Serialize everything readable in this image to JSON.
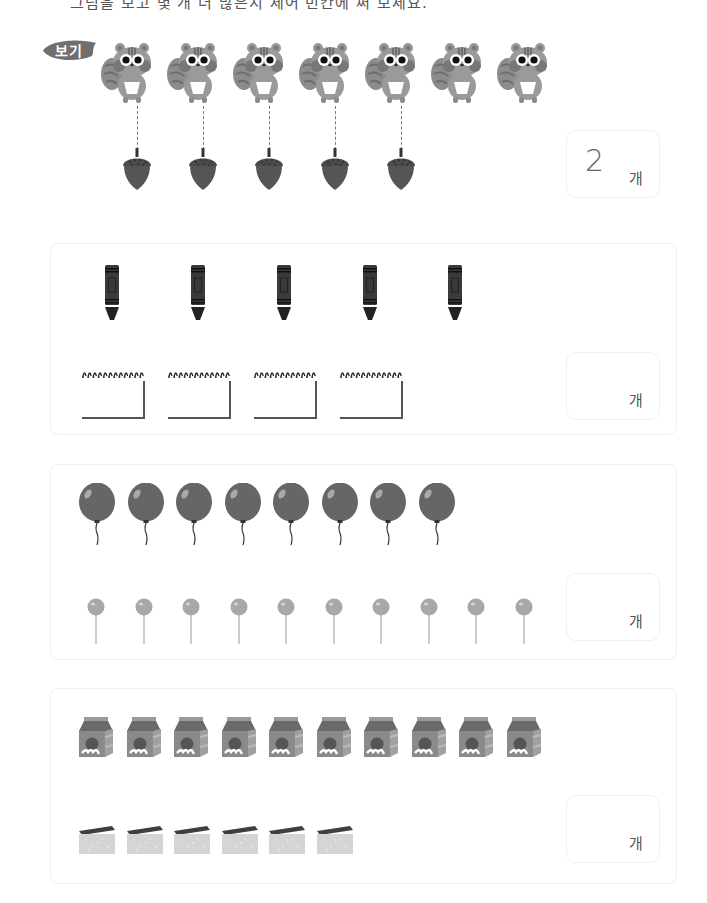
{
  "header": {
    "instruction_cut": "그림을 보고 몇 개 더 많은지 세어 빈칸에 써 보세요."
  },
  "example": {
    "badge_label": "보기",
    "squirrels": {
      "count": 7,
      "x": [
        100,
        166,
        232,
        298,
        364,
        430,
        496
      ],
      "y": 40
    },
    "acorns": {
      "count": 5,
      "x": [
        121,
        187,
        253,
        319,
        385
      ],
      "y": 148
    },
    "answer": {
      "value": "2",
      "unit": "개"
    }
  },
  "sections": [
    {
      "id": "crayons-notepads",
      "box": {
        "x": 50,
        "y": 243,
        "w": 625,
        "h": 190
      },
      "row1": {
        "kind": "crayon",
        "count": 5,
        "x": [
          104,
          190,
          276,
          362,
          447
        ],
        "y": 265
      },
      "row2": {
        "kind": "notepad",
        "count": 4,
        "x": [
          80,
          166,
          252,
          338
        ],
        "y": 369
      },
      "answer": {
        "x": 566,
        "y": 352,
        "w": 92,
        "h": 66,
        "value": "",
        "unit": "개"
      }
    },
    {
      "id": "balloons-lollipops",
      "box": {
        "x": 50,
        "y": 464,
        "w": 625,
        "h": 194
      },
      "row1": {
        "kind": "balloon",
        "count": 8,
        "x": [
          77,
          126,
          174,
          223,
          271,
          320,
          368,
          417
        ],
        "y": 483
      },
      "row2": {
        "kind": "lollipop",
        "count": 10,
        "x": [
          86,
          134,
          181,
          229,
          276,
          324,
          371,
          419,
          466,
          514
        ],
        "y": 598
      },
      "answer": {
        "x": 566,
        "y": 573,
        "w": 92,
        "h": 66,
        "value": "",
        "unit": "개"
      }
    },
    {
      "id": "milk-sponges",
      "box": {
        "x": 50,
        "y": 688,
        "w": 625,
        "h": 194
      },
      "row1": {
        "kind": "milk",
        "count": 10,
        "x": [
          78,
          126,
          173,
          221,
          268,
          316,
          363,
          411,
          458,
          506
        ],
        "y": 715
      },
      "row2": {
        "kind": "sponge",
        "count": 6,
        "x": [
          78,
          126,
          173,
          221,
          268,
          316
        ],
        "y": 825
      },
      "answer": {
        "x": 566,
        "y": 795,
        "w": 92,
        "h": 66,
        "value": "",
        "unit": "개"
      }
    }
  ],
  "colors": {
    "badge": "#6f6f6f",
    "squirrel_body": "#9a9a9a",
    "squirrel_cheek": "#777777",
    "acorn": "#555555",
    "crayon": "#3a3a3a",
    "balloon": "#666666",
    "lollipop": "#a8a8a8",
    "milk": "#8a8a8a",
    "sponge_top": "#3f3f3f",
    "sponge_body": "#d4d4d4"
  }
}
